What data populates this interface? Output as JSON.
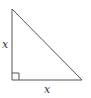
{
  "diagram": {
    "type": "right-triangle",
    "vertices": {
      "top": [
        12,
        9
      ],
      "bottom_left": [
        12,
        80
      ],
      "bottom_right": [
        82,
        80
      ]
    },
    "right_angle_marker": true,
    "labels": {
      "left_leg": "x",
      "bottom_leg": "x"
    },
    "colors": {
      "stroke": "#555555",
      "background": "#ffffff"
    }
  }
}
